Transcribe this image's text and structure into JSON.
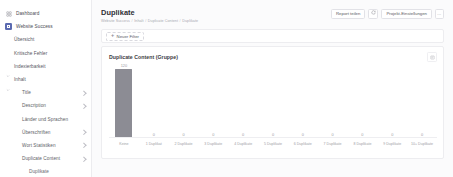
{
  "sidebar": {
    "items": [
      {
        "label": "Dashboard",
        "level": 0,
        "icon": "grid-icon",
        "chevron": false,
        "caret": false
      },
      {
        "label": "Website Success",
        "level": 0,
        "icon": "brand-square-icon",
        "chevron": false,
        "caret": false
      },
      {
        "label": "Übersicht",
        "level": 1,
        "icon": "",
        "chevron": false,
        "caret": false
      },
      {
        "label": "Kritische Fehler",
        "level": 1,
        "icon": "",
        "chevron": false,
        "caret": false
      },
      {
        "label": "Indexierbarkeit",
        "level": 1,
        "icon": "",
        "chevron": false,
        "caret": true
      },
      {
        "label": "Inhalt",
        "level": 1,
        "icon": "",
        "chevron": false,
        "caret": true
      },
      {
        "label": "Title",
        "level": 2,
        "icon": "",
        "chevron": true,
        "caret": false
      },
      {
        "label": "Description",
        "level": 2,
        "icon": "",
        "chevron": true,
        "caret": false
      },
      {
        "label": "Länder und Sprachen",
        "level": 2,
        "icon": "",
        "chevron": false,
        "caret": false
      },
      {
        "label": "Überschriften",
        "level": 2,
        "icon": "",
        "chevron": true,
        "caret": false
      },
      {
        "label": "Wort Statistiken",
        "level": 2,
        "icon": "",
        "chevron": true,
        "caret": false
      },
      {
        "label": "Duplicate Content",
        "level": 2,
        "icon": "",
        "chevron": true,
        "caret": false
      },
      {
        "label": "Duplikate",
        "level": 3,
        "icon": "",
        "chevron": false,
        "caret": false
      }
    ]
  },
  "header": {
    "title": "Duplikate",
    "breadcrumb": [
      "Website Success",
      "Inhalt",
      "Duplicate Content",
      "Duplikate"
    ],
    "share_label": "Report teilen",
    "refresh_icon": "refresh-icon",
    "settings_label": "Projekt-Einstellungen",
    "more_label": "…"
  },
  "filterbar": {
    "new_filter_label": "Neuer Filter",
    "plus_icon": "plus-icon"
  },
  "card": {
    "title": "Duplicate Content (Gruppe)",
    "menu_icon": "panel-menu-icon"
  },
  "chart_data": {
    "type": "bar",
    "title": "Duplicate Content (Gruppe)",
    "xlabel": "",
    "ylabel": "",
    "grid": false,
    "legend": false,
    "ylim": [
      0,
      130
    ],
    "bar_color": "#8c8c94",
    "categories": [
      "Keine",
      "1 Duplikat",
      "2 Duplikate",
      "3 Duplikate",
      "4 Duplikate",
      "5 Duplikate",
      "6 Duplikate",
      "7 Duplikate",
      "8 Duplikate",
      "9 Duplikate",
      "10+ Duplikate"
    ],
    "values": [
      120,
      0,
      0,
      0,
      0,
      0,
      0,
      0,
      0,
      0,
      0
    ]
  },
  "colors": {
    "accent": "#5b6ab0",
    "bar": "#8c8c94",
    "border": "#ededf0",
    "text": "#3c3c3c",
    "muted": "#9d9da5"
  }
}
